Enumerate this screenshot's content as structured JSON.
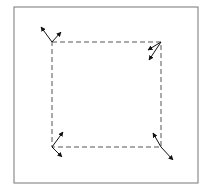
{
  "diagram": {
    "title": "",
    "frame": {
      "x": 14,
      "y": 7,
      "w": 184,
      "h": 176,
      "stroke": "#777777"
    },
    "square": {
      "corners": [
        [
          52,
          42
        ],
        [
          161,
          42
        ],
        [
          161,
          147
        ],
        [
          52,
          147
        ]
      ],
      "stroke": "#555555",
      "dash": "5,3"
    },
    "arrow_color": "#111111",
    "vectors": [
      {
        "name": "top-left-vector-a",
        "from": [
          52,
          42
        ],
        "to": [
          41,
          27
        ]
      },
      {
        "name": "top-left-vector-b",
        "from": [
          52,
          42
        ],
        "to": [
          61,
          32
        ]
      },
      {
        "name": "top-right-vector-a",
        "from": [
          161,
          42
        ],
        "to": [
          148,
          50
        ]
      },
      {
        "name": "top-right-vector-b",
        "from": [
          161,
          42
        ],
        "to": [
          149,
          60
        ]
      },
      {
        "name": "bottom-left-vector-a",
        "from": [
          52,
          147
        ],
        "to": [
          63,
          132
        ]
      },
      {
        "name": "bottom-left-vector-b",
        "from": [
          52,
          147
        ],
        "to": [
          62,
          157
        ]
      },
      {
        "name": "bottom-right-vector-a",
        "from": [
          161,
          147
        ],
        "to": [
          153,
          133
        ]
      },
      {
        "name": "bottom-right-vector-b",
        "from": [
          161,
          147
        ],
        "to": [
          173,
          160
        ]
      }
    ]
  }
}
